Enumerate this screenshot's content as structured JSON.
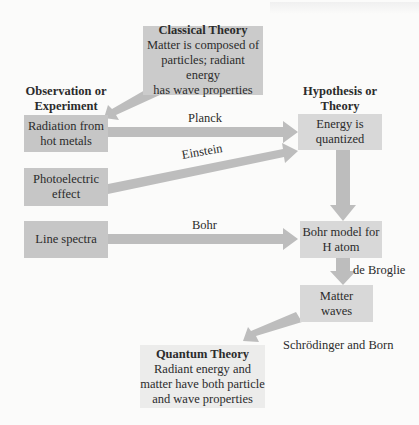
{
  "colors": {
    "observation_box": "#c6c6c6",
    "hypothesis_box": "#d8d8d8",
    "classical_box": "#cbcbcb",
    "quantum_box": "#ececeb",
    "arrow": "#bdbdbd",
    "background": "#fbfbfa"
  },
  "headings": {
    "observation": [
      "Observation or",
      "Experiment"
    ],
    "hypothesis": [
      "Hypothesis or",
      "Theory"
    ]
  },
  "classical_theory": {
    "title": "Classical Theory",
    "lines": [
      "Matter is composed of",
      "particles; radiant energy",
      "has wave properties"
    ]
  },
  "observations": [
    {
      "lines": [
        "Radiation from",
        "hot metals"
      ]
    },
    {
      "lines": [
        "Photoelectric",
        "effect"
      ]
    },
    {
      "lines": [
        "Line spectra"
      ]
    }
  ],
  "hypotheses": [
    {
      "lines": [
        "Energy is",
        "quantized"
      ]
    },
    {
      "lines": [
        "Bohr model for",
        "H atom"
      ]
    },
    {
      "lines": [
        "Matter",
        "waves"
      ]
    }
  ],
  "quantum_theory": {
    "title": "Quantum Theory",
    "lines": [
      "Radiant energy and",
      "matter have both particle",
      "and wave properties"
    ]
  },
  "arrow_labels": {
    "planck": "Planck",
    "einstein": "Einstein",
    "bohr": "Bohr",
    "de_broglie": "de Broglie",
    "schrodinger_born": "Schrödinger and Born"
  }
}
